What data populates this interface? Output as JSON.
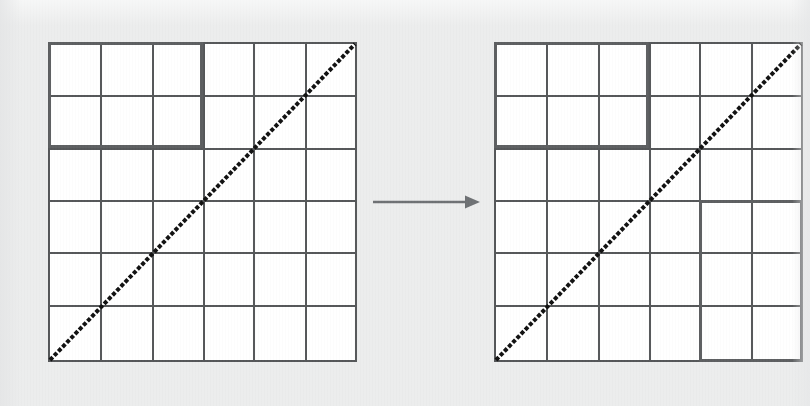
{
  "figure": {
    "caption": "",
    "background_color": "#eceded",
    "paper_color": "#ffffff",
    "line_color": "#555759",
    "highlight_color": "#5d5f61",
    "diagonal_color": "#111111",
    "arrow_color": "#6e7174",
    "width": 810,
    "height": 406,
    "ghost_text": "bleed-through"
  },
  "panels": [
    {
      "id": "left-matrix",
      "name": "before-matrix",
      "label": "",
      "x": 48,
      "y": 42,
      "width": 309,
      "height": 320,
      "rows": 6,
      "cols": 6,
      "col_lines": [
        0,
        52,
        104,
        155,
        205,
        257,
        309
      ],
      "row_lines": [
        0,
        53,
        106,
        158,
        210,
        263,
        320
      ],
      "diagonal": {
        "style": "dotted",
        "from": "bottom-left",
        "to": "top-right",
        "dot_size": 4,
        "dot_gap": 2
      },
      "blocks": [
        {
          "id": "left-block-1",
          "name": "highlighted-block-top-left",
          "label": "",
          "col_start": 1,
          "col_end": 3,
          "row_start": 1,
          "row_end": 2
        }
      ]
    },
    {
      "id": "right-matrix",
      "name": "after-matrix",
      "label": "",
      "x": 494,
      "y": 42,
      "width": 309,
      "height": 320,
      "rows": 6,
      "cols": 6,
      "col_lines": [
        0,
        52,
        104,
        155,
        205,
        257,
        309
      ],
      "row_lines": [
        0,
        53,
        106,
        158,
        210,
        263,
        320
      ],
      "diagonal": {
        "style": "dotted",
        "from": "bottom-left",
        "to": "top-right",
        "dot_size": 4,
        "dot_gap": 2
      },
      "blocks": [
        {
          "id": "right-block-1",
          "name": "highlighted-block-top-left",
          "label": "",
          "col_start": 1,
          "col_end": 3,
          "row_start": 1,
          "row_end": 2
        },
        {
          "id": "right-block-2",
          "name": "highlighted-block-bottom-right",
          "label": "",
          "col_start": 5,
          "col_end": 6,
          "row_start": 4,
          "row_end": 6
        }
      ]
    }
  ],
  "arrow": {
    "name": "transformation-arrow",
    "label": "",
    "direction": "right",
    "x": 373,
    "y": 202,
    "length": 103,
    "color": "#6e7174"
  }
}
